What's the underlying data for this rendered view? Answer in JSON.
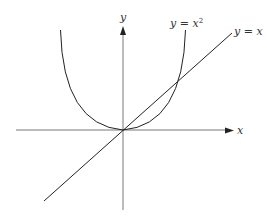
{
  "diagram": {
    "axes": {
      "x_label": "x",
      "y_label": "y"
    },
    "curves": [
      {
        "name": "parabola",
        "label_prefix": "y = ",
        "label_var": "x",
        "label_sup": "2"
      },
      {
        "name": "line",
        "label": "y = x"
      }
    ],
    "stroke_color": "#222222"
  }
}
